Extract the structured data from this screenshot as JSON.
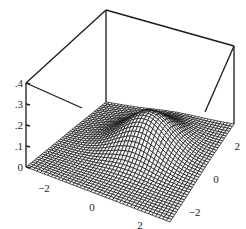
{
  "chart_data": {
    "type": "surface3d",
    "title": "",
    "function": "gaussian bump z = A*exp(-((x-x0)^2+(y-y0)^2)/(2*s^2))",
    "params": {
      "A": 0.16,
      "x0": 0.3,
      "y0": 0.6,
      "s": 1.0
    },
    "x_range": [
      -3,
      3
    ],
    "y_range": [
      -3,
      3
    ],
    "z_range": [
      0,
      0.4
    ],
    "grid_n": 40,
    "x_ticks": [
      "-2",
      "0",
      "2"
    ],
    "y_ticks": [
      "2",
      "0",
      "-2"
    ],
    "z_ticks": [
      "0",
      ".1",
      ".2",
      ".3",
      ".4"
    ],
    "xlabel": "",
    "ylabel": "",
    "zlabel": "",
    "box": true,
    "colors": {
      "mesh_line": "#111111",
      "mesh_fill": "#f4f4f4",
      "box": "#1a1a1a",
      "background": "#ffffff"
    }
  },
  "axes": {
    "z_ticks": [
      ".4",
      ".3",
      ".2",
      ".1",
      "0"
    ],
    "x_ticks": [
      "-2",
      "0",
      "2"
    ],
    "y_ticks": [
      "2",
      "0",
      "-2"
    ]
  }
}
